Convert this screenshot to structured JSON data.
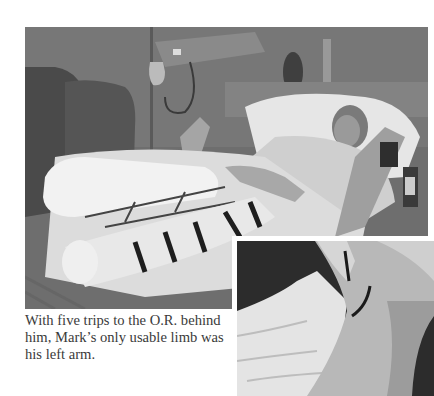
{
  "main_photo": {
    "description": "Patient lying in hospital bed with both legs in casts, elevated on supports, IV stand and equipment in background",
    "tone": "grayscale"
  },
  "inset_photo": {
    "description": "Close-up of arm with a long suture line, against a dark background and white bedsheets",
    "tone": "grayscale"
  },
  "caption": {
    "text": "With five trips to the O.R. behind him, Mark’s only usable limb was his left arm."
  },
  "colors": {
    "page_background": "#ffffff",
    "caption_text": "#3a3a3a"
  }
}
